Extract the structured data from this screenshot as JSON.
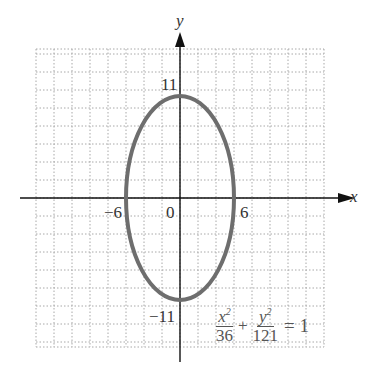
{
  "chart_data": {
    "type": "line",
    "title": "",
    "xlabel": "x",
    "ylabel": "y",
    "curve": "ellipse",
    "equation": "x^2/36 + y^2/121 = 1",
    "center": [
      0,
      0
    ],
    "semi_axes": {
      "a": 6,
      "b": 11
    },
    "tick_labels": {
      "x": [
        "-6",
        "0",
        "6"
      ],
      "y": [
        "11",
        "-11"
      ]
    },
    "grid": true,
    "grid_unit": 2,
    "xlim": [
      -16,
      16
    ],
    "ylim": [
      -15,
      17
    ]
  },
  "labels": {
    "x_axis": "x",
    "y_axis": "y",
    "y_top": "11",
    "y_bottom": "−11",
    "x_left": "−6",
    "x_origin": "0",
    "x_right": "6"
  },
  "equation": {
    "num1": "x",
    "sup1": "2",
    "den1": "36",
    "plus": "+",
    "num2": "y",
    "sup2": "2",
    "den2": "121",
    "rhs": "= 1"
  },
  "colors": {
    "curve": "#6e6e6e",
    "axes": "#111111",
    "grid": "#999999"
  }
}
